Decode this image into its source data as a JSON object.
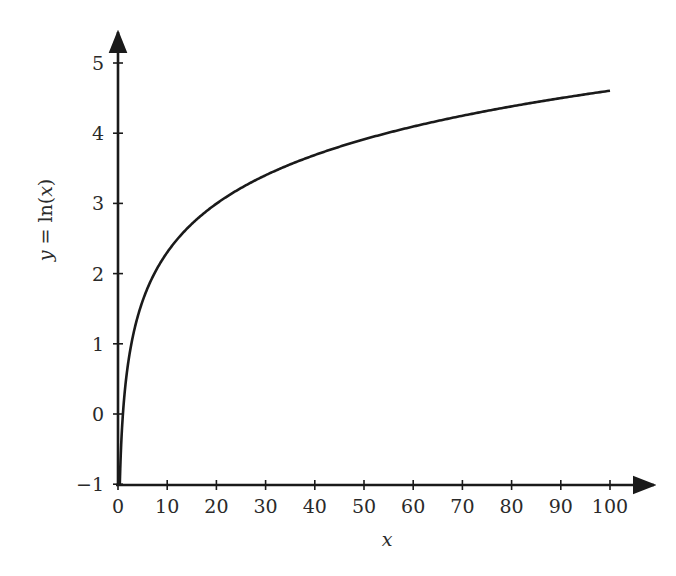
{
  "chart_data": {
    "type": "line",
    "title": "",
    "xlabel": "x",
    "ylabel": "y = ln(x)",
    "ylabel_parts": {
      "y": "y",
      "eq": " = ln(",
      "x": "x",
      "close": ")"
    },
    "xlim": [
      0,
      100
    ],
    "ylim": [
      -1,
      5
    ],
    "xticks": [
      0,
      10,
      20,
      30,
      40,
      50,
      60,
      70,
      80,
      90,
      100
    ],
    "yticks": [
      -1,
      0,
      1,
      2,
      3,
      4,
      5
    ],
    "ytick_labels": [
      "−1",
      "0",
      "1",
      "2",
      "3",
      "4",
      "5"
    ],
    "grid": false,
    "legend": null,
    "series": [
      {
        "name": "ln(x)",
        "function": "ln(x)",
        "color": "#1a1a1a",
        "x": [
          0.368,
          0.5,
          1,
          2,
          3,
          5,
          7,
          10,
          15,
          20,
          30,
          40,
          50,
          60,
          70,
          80,
          90,
          100
        ],
        "y": [
          -1,
          -0.69,
          0,
          0.69,
          1.1,
          1.61,
          1.95,
          2.3,
          2.71,
          3.0,
          3.4,
          3.69,
          3.91,
          4.09,
          4.25,
          4.38,
          4.5,
          4.61
        ]
      }
    ]
  },
  "colors": {
    "axis": "#1a1a1a",
    "curve": "#1a1a1a",
    "text": "#2a2a2a",
    "background": "#ffffff"
  }
}
